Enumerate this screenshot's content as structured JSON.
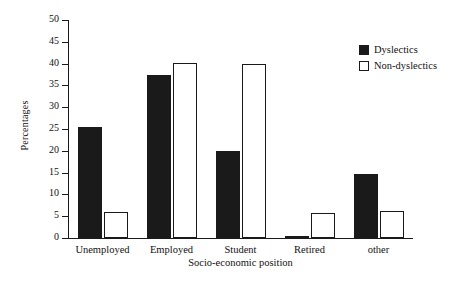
{
  "chart_data": {
    "type": "bar",
    "title": "",
    "xlabel": "Socio-economic position",
    "ylabel": "Percentages",
    "categories": [
      "Unemployed",
      "Employed",
      "Student",
      "Retired",
      "other"
    ],
    "series": [
      {
        "name": "Dyslectics",
        "color": "#1a1a1a",
        "fill": "solid",
        "values": [
          25.4,
          37.4,
          19.9,
          0.5,
          14.6
        ]
      },
      {
        "name": "Non-dyslectics",
        "color": "#ffffff",
        "fill": "hollow",
        "values": [
          6.0,
          40.2,
          40.0,
          5.7,
          6.1
        ]
      }
    ],
    "ylim": [
      0,
      50
    ],
    "ytick_values": [
      0,
      5,
      10,
      15,
      20,
      25,
      30,
      35,
      40,
      45,
      50
    ],
    "ytick_labels": [
      "0",
      "5",
      "10",
      "15",
      "20",
      "25",
      "30",
      "35",
      "40",
      "45",
      "50"
    ],
    "grid": false,
    "legend_position": "top-right",
    "legend_entries": [
      "Dyslectics",
      "Non-dyslectics"
    ]
  }
}
